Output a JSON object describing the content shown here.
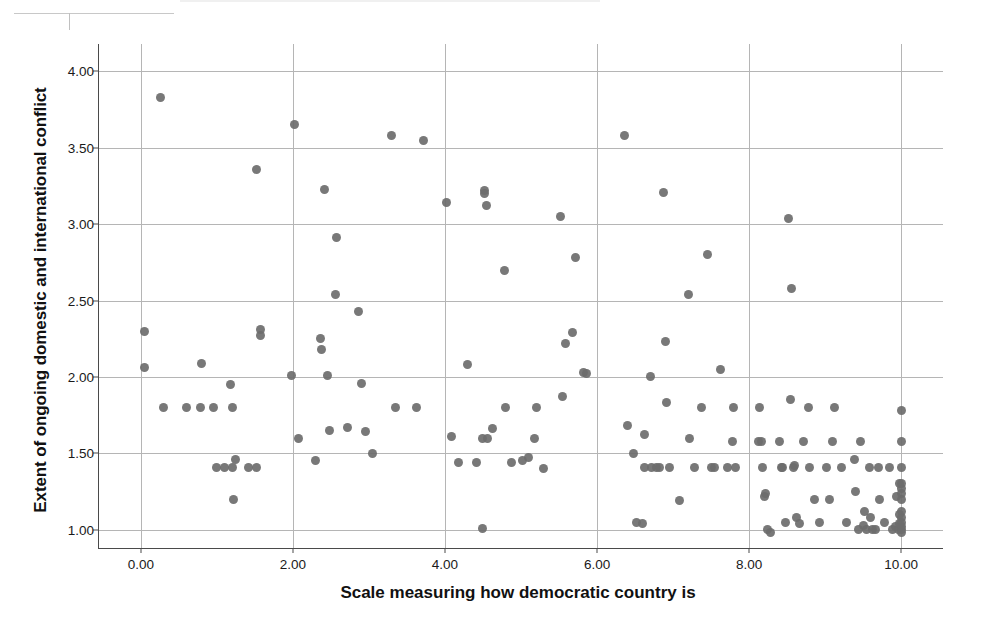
{
  "chart_data": {
    "type": "scatter",
    "title": "",
    "xlabel": "Scale measuring how democratic country is",
    "ylabel": "Extent of ongoing domestic and international conflict",
    "xlim": [
      -0.55,
      10.55
    ],
    "ylim": [
      0.88,
      4.18
    ],
    "xticks": [
      "0.00",
      "2.00",
      "4.00",
      "6.00",
      "8.00",
      "10.00"
    ],
    "xtick_values": [
      0,
      2,
      4,
      6,
      8,
      10
    ],
    "yticks": [
      "1.00",
      "1.50",
      "2.00",
      "2.50",
      "3.00",
      "3.50",
      "4.00"
    ],
    "ytick_values": [
      1.0,
      1.5,
      2.0,
      2.5,
      3.0,
      3.5,
      4.0
    ],
    "grid": true,
    "legend": false,
    "marker_color": "#6d6d6d",
    "marker_size": 9,
    "n_points": 160,
    "points": [
      [
        0.05,
        2.3
      ],
      [
        0.05,
        2.06
      ],
      [
        0.26,
        3.83
      ],
      [
        0.3,
        1.8
      ],
      [
        0.6,
        1.8
      ],
      [
        0.78,
        1.8
      ],
      [
        0.8,
        2.09
      ],
      [
        0.95,
        1.8
      ],
      [
        1.0,
        1.41
      ],
      [
        1.1,
        1.41
      ],
      [
        1.2,
        1.41
      ],
      [
        1.18,
        1.95
      ],
      [
        1.2,
        1.8
      ],
      [
        1.22,
        1.2
      ],
      [
        1.25,
        1.46
      ],
      [
        1.42,
        1.41
      ],
      [
        1.52,
        1.41
      ],
      [
        1.52,
        3.36
      ],
      [
        1.58,
        2.31
      ],
      [
        1.58,
        2.27
      ],
      [
        1.98,
        2.01
      ],
      [
        2.02,
        3.65
      ],
      [
        2.08,
        1.6
      ],
      [
        2.3,
        1.45
      ],
      [
        2.36,
        2.25
      ],
      [
        2.38,
        2.18
      ],
      [
        2.42,
        3.23
      ],
      [
        2.45,
        2.01
      ],
      [
        2.48,
        1.65
      ],
      [
        2.56,
        2.54
      ],
      [
        2.58,
        2.91
      ],
      [
        2.72,
        1.67
      ],
      [
        2.86,
        2.43
      ],
      [
        2.9,
        1.96
      ],
      [
        2.95,
        1.64
      ],
      [
        3.05,
        1.5
      ],
      [
        3.3,
        3.58
      ],
      [
        3.35,
        1.8
      ],
      [
        3.62,
        1.8
      ],
      [
        3.72,
        3.55
      ],
      [
        4.02,
        3.14
      ],
      [
        4.08,
        1.61
      ],
      [
        4.18,
        1.44
      ],
      [
        4.3,
        2.08
      ],
      [
        4.42,
        1.44
      ],
      [
        4.5,
        1.6
      ],
      [
        4.52,
        3.22
      ],
      [
        4.52,
        3.2
      ],
      [
        4.54,
        3.12
      ],
      [
        4.56,
        1.6
      ],
      [
        4.5,
        1.01
      ],
      [
        4.62,
        1.66
      ],
      [
        4.78,
        2.7
      ],
      [
        4.8,
        1.8
      ],
      [
        4.88,
        1.44
      ],
      [
        5.02,
        1.45
      ],
      [
        5.1,
        1.47
      ],
      [
        5.18,
        1.6
      ],
      [
        5.2,
        1.8
      ],
      [
        5.3,
        1.4
      ],
      [
        5.52,
        3.05
      ],
      [
        5.55,
        1.87
      ],
      [
        5.58,
        2.22
      ],
      [
        5.68,
        2.29
      ],
      [
        5.72,
        2.78
      ],
      [
        5.82,
        2.03
      ],
      [
        5.86,
        2.02
      ],
      [
        6.36,
        3.58
      ],
      [
        6.4,
        1.68
      ],
      [
        6.48,
        1.5
      ],
      [
        6.52,
        1.05
      ],
      [
        6.6,
        1.04
      ],
      [
        6.62,
        1.62
      ],
      [
        6.62,
        1.41
      ],
      [
        6.7,
        2.0
      ],
      [
        6.72,
        1.41
      ],
      [
        6.78,
        1.41
      ],
      [
        6.82,
        1.41
      ],
      [
        6.88,
        3.21
      ],
      [
        6.9,
        2.23
      ],
      [
        6.92,
        1.83
      ],
      [
        6.95,
        1.41
      ],
      [
        7.08,
        1.19
      ],
      [
        7.2,
        2.54
      ],
      [
        7.22,
        1.6
      ],
      [
        7.28,
        1.41
      ],
      [
        7.38,
        1.8
      ],
      [
        7.45,
        2.8
      ],
      [
        7.5,
        1.41
      ],
      [
        7.55,
        1.41
      ],
      [
        7.62,
        2.05
      ],
      [
        7.72,
        1.41
      ],
      [
        7.78,
        1.58
      ],
      [
        7.8,
        1.8
      ],
      [
        7.82,
        1.41
      ],
      [
        8.12,
        1.58
      ],
      [
        8.14,
        1.8
      ],
      [
        8.16,
        1.58
      ],
      [
        8.18,
        1.41
      ],
      [
        8.2,
        1.22
      ],
      [
        8.22,
        1.24
      ],
      [
        8.24,
        1.0
      ],
      [
        8.28,
        0.98
      ],
      [
        8.4,
        1.58
      ],
      [
        8.42,
        1.41
      ],
      [
        8.44,
        1.41
      ],
      [
        8.48,
        1.05
      ],
      [
        8.52,
        3.04
      ],
      [
        8.54,
        1.85
      ],
      [
        8.56,
        2.58
      ],
      [
        8.58,
        1.41
      ],
      [
        8.6,
        1.42
      ],
      [
        8.62,
        1.08
      ],
      [
        8.66,
        1.04
      ],
      [
        8.72,
        1.58
      ],
      [
        8.78,
        1.8
      ],
      [
        8.8,
        1.41
      ],
      [
        8.86,
        1.2
      ],
      [
        8.92,
        1.05
      ],
      [
        9.02,
        1.41
      ],
      [
        9.06,
        1.2
      ],
      [
        9.1,
        1.58
      ],
      [
        9.12,
        1.8
      ],
      [
        9.22,
        1.41
      ],
      [
        9.28,
        1.05
      ],
      [
        9.38,
        1.46
      ],
      [
        9.4,
        1.25
      ],
      [
        9.46,
        1.58
      ],
      [
        9.5,
        1.03
      ],
      [
        9.52,
        1.12
      ],
      [
        9.55,
        1.0
      ],
      [
        9.58,
        1.41
      ],
      [
        9.6,
        1.08
      ],
      [
        9.62,
        1.0
      ],
      [
        9.66,
        1.0
      ],
      [
        9.7,
        1.41
      ],
      [
        9.72,
        1.2
      ],
      [
        9.78,
        1.05
      ],
      [
        9.84,
        1.41
      ],
      [
        9.88,
        1.0
      ],
      [
        9.92,
        1.02
      ],
      [
        9.96,
        1.0
      ],
      [
        10.0,
        1.78
      ],
      [
        10.0,
        1.58
      ],
      [
        10.0,
        1.41
      ],
      [
        10.0,
        1.3
      ],
      [
        10.0,
        1.27
      ],
      [
        10.0,
        1.24
      ],
      [
        10.0,
        1.2
      ],
      [
        10.0,
        1.12
      ],
      [
        10.0,
        1.08
      ],
      [
        10.0,
        1.05
      ],
      [
        10.0,
        1.02
      ],
      [
        10.0,
        1.0
      ],
      [
        10.0,
        0.98
      ],
      [
        9.98,
        1.3
      ],
      [
        9.98,
        1.1
      ],
      [
        9.98,
        1.04
      ],
      [
        9.94,
        1.22
      ],
      [
        9.44,
        1.0
      ]
    ]
  },
  "figure": {
    "background_color": "#ffffff",
    "grid_color": "#b5b5b5",
    "axis_color": "#4a4a4a",
    "text_color": "#111111"
  }
}
